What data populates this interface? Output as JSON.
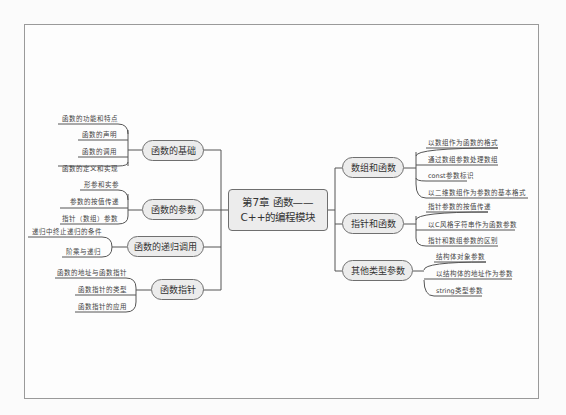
{
  "mindmap": {
    "center": {
      "line1": "第7章  函数——",
      "line2": "C++的编程模块"
    },
    "left_branches": [
      {
        "label": "函数的基础",
        "children": [
          "函数的功能和特点",
          "函数的声明",
          "函数的调用",
          "函数的定义和实现"
        ]
      },
      {
        "label": "函数的参数",
        "children": [
          "形参和实参",
          "参数的按值传递",
          "指针（数组）参数"
        ]
      },
      {
        "label": "函数的递归调用",
        "children": [
          "递归中终止递归的条件",
          "阶乘与递归"
        ]
      },
      {
        "label": "函数指针",
        "children": [
          "函数的地址与函数指针",
          "函数指针的类型",
          "函数指针的应用"
        ]
      }
    ],
    "right_branches": [
      {
        "label": "数组和函数",
        "children": [
          "以数组作为函数的格式",
          "通过数组参数处理数组",
          "const参数标识",
          "以二维数组作为参数的基本格式"
        ]
      },
      {
        "label": "指针和函数",
        "children": [
          "指针参数的按值传递",
          "以C风格字符串作为函数参数",
          "指针和数组参数的区别"
        ]
      },
      {
        "label": "其他类型参数",
        "children": [
          "结构体对象参数",
          "以结构体的地址作为参数",
          "string类型参数"
        ]
      }
    ]
  },
  "colors": {
    "node_fill": "#ececec",
    "node_border": "#6f6f6f",
    "line": "#555555",
    "frame": "#9a9a9a"
  }
}
